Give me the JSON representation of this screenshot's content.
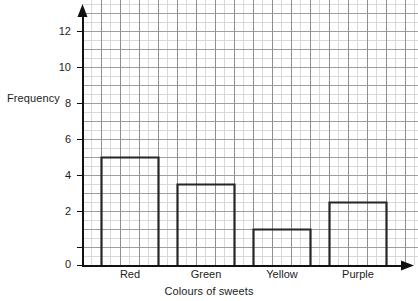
{
  "chart_data": {
    "type": "bar",
    "title": "",
    "subtitle": "",
    "xlabel": "Colours of sweets",
    "ylabel": "Frequency",
    "categories": [
      "Red",
      "Green",
      "Yellow",
      "Purple"
    ],
    "values": [
      12,
      9,
      4,
      7
    ],
    "ylim": [
      0,
      14
    ],
    "xlim": [
      0,
      16
    ],
    "y_ticks": [
      0,
      2,
      4,
      6,
      8,
      10,
      12
    ],
    "y_tick_labels": [
      "0",
      "2",
      "4",
      "6",
      "8",
      "10",
      "12"
    ],
    "grid": true,
    "grid_minor": true,
    "legend": "none",
    "bar_style": "outline",
    "annotations": []
  },
  "axes": {
    "y_title": "Frequency",
    "x_title": "Colours of sweets"
  },
  "ticks": {
    "y": [
      {
        "value": 12,
        "label": "12"
      },
      {
        "value": 10,
        "label": "10"
      },
      {
        "value": 8,
        "label": "8"
      },
      {
        "value": 6,
        "label": "6"
      },
      {
        "value": 4,
        "label": "4"
      },
      {
        "value": 2,
        "label": "2"
      },
      {
        "value": 0,
        "label": "0"
      }
    ],
    "x": [
      {
        "label": "Red"
      },
      {
        "label": "Green"
      },
      {
        "label": "Yellow"
      },
      {
        "label": "Purple"
      }
    ]
  },
  "colors": {
    "background": "#ffffff",
    "grid_minor": "#d8d8d8",
    "grid_major": "#9a9a9a",
    "axis": "#111111",
    "bar_stroke": "#262626",
    "text": "#1b1b1b"
  }
}
